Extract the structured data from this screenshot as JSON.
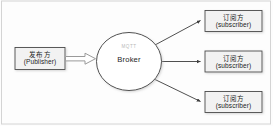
{
  "diagram": {
    "type": "mqtt-publish-subscribe-architecture",
    "background_color": "#fdfdfd",
    "frame_border_color": "#cfcfcf",
    "publisher": {
      "name_cn": "发布方",
      "name_en": "(Publisher)",
      "fill_color": "#f2f2f2",
      "border_color": "#4a4a4a"
    },
    "broker": {
      "protocol_label": "MQTT",
      "name": "Broker",
      "fill_color": "#ffffff",
      "border_color": "#3c3c3c",
      "protocol_label_color": "#b9b9b9"
    },
    "subscribers": [
      {
        "name_cn": "订阅方",
        "name_en": "(subscriber)",
        "fill_color": "#f2f2f2",
        "border_color": "#4a4a4a"
      },
      {
        "name_cn": "订阅方",
        "name_en": "(subscriber)",
        "fill_color": "#f2f2f2",
        "border_color": "#4a4a4a"
      },
      {
        "name_cn": "订阅方",
        "name_en": "(subscriber)",
        "fill_color": "#f2f2f2",
        "border_color": "#4a4a4a"
      }
    ],
    "connections": [
      {
        "id": "publish-arrow",
        "from": "publisher",
        "to": "broker",
        "style": "block-arrow",
        "stroke_color": "#9a9a9a",
        "fill_color": "#ffffff"
      },
      {
        "id": "subscribe-arrow-top",
        "from": "broker",
        "to": "subscriber-1",
        "style": "line-arrow",
        "stroke_color": "#3c3c3c"
      },
      {
        "id": "subscribe-arrow-middle",
        "from": "broker",
        "to": "subscriber-2",
        "style": "line-arrow",
        "stroke_color": "#3c3c3c"
      },
      {
        "id": "subscribe-arrow-bottom",
        "from": "broker",
        "to": "subscriber-3",
        "style": "line-arrow",
        "stroke_color": "#3c3c3c"
      }
    ]
  }
}
